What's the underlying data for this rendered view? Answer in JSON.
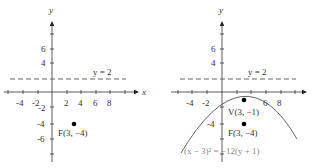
{
  "figures": [
    {
      "id": "left",
      "axis_labels": {
        "x": "x",
        "y": "y"
      },
      "x_ticks": [
        "-4",
        "-2",
        "2",
        "4",
        "6",
        "8"
      ],
      "y_ticks": [
        "6",
        "4",
        "-2",
        "-4",
        "-6"
      ],
      "directrix_label": "y = 2",
      "focus_label": "F(3, −4)"
    },
    {
      "id": "right",
      "axis_labels": {
        "y": "y"
      },
      "x_ticks": [
        "-4",
        "-2",
        "6",
        "8"
      ],
      "y_ticks": [
        "6",
        "4",
        "-4"
      ],
      "directrix_label": "y = 2",
      "vertex_label": "V(3, −1)",
      "focus_label": "F(3, −4)",
      "equation_label": "(x − 3)² = −12(y + 1)"
    }
  ],
  "colors": {
    "axis": "#333333",
    "dashed": "#666666",
    "curve": "#555555",
    "point": "#000000",
    "equation": "#999999"
  }
}
